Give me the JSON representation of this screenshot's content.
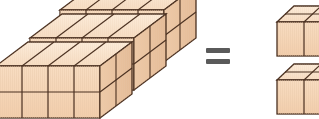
{
  "diagram": {
    "background_color": "#ffffff",
    "operator": {
      "symbol": "=",
      "name": "equals"
    },
    "colors": {
      "cube_front": "#f6d9bc",
      "cube_front_shade": "#f3cfae",
      "cube_top": "#fae7d2",
      "cube_side": "#e9c4a1",
      "edge": "#4a3020",
      "edge_light": "#6b4a30",
      "background": "#ffffff"
    },
    "left_group": {
      "name": "three-slab-stack",
      "slab_count": 3,
      "slab_front_columns": 4,
      "slab_front_rows": 2,
      "cubes_per_slab": 8,
      "total_cubes": 24,
      "note": "Slabs offset diagonally up and to the right"
    },
    "right_group": {
      "name": "two-block-stack",
      "block_count": 2,
      "block_columns": 2,
      "block_rows": 2,
      "cubes_per_block": 4,
      "total_cubes": 8,
      "note": "Two separate blocks, upper and lower, clipped at right edge"
    }
  }
}
